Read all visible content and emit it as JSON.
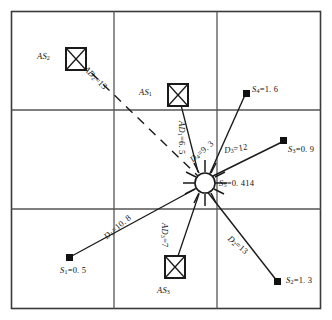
{
  "figure": {
    "type": "diagram",
    "grid": {
      "rows": 3,
      "cols": 3,
      "border_color": "#3a3a3a",
      "line_color": "#555555"
    },
    "center_node": {
      "name": "center-sun-node",
      "label_symbol": "S",
      "label_sub": "5",
      "label_value": "=0. 414",
      "label_full": "S5 =0. 414",
      "x": 205,
      "y": 182
    },
    "sensor_nodes": [
      {
        "id": "S1",
        "symbol": "S",
        "sub": "1",
        "value": "=0. 5",
        "label": "S1=0.5",
        "x": 68,
        "y": 258,
        "label_x": 64,
        "label_y": 266
      },
      {
        "id": "S2",
        "symbol": "S",
        "sub": "2",
        "value": "=1. 3",
        "label": "S2=1.3",
        "x": 278,
        "y": 282,
        "label_x": 286,
        "label_y": 276
      },
      {
        "id": "S3",
        "symbol": "S",
        "sub": "3",
        "value": "=0. 9",
        "label": "S3=0.9",
        "x": 284,
        "y": 140,
        "label_x": 288,
        "label_y": 148
      },
      {
        "id": "S4",
        "symbol": "S",
        "sub": "4",
        "value": "=1. 6",
        "label": "S4=1.6",
        "x": 247,
        "y": 93,
        "label_x": 252,
        "label_y": 87
      }
    ],
    "anchor_nodes": [
      {
        "id": "AS1",
        "symbol": "AS",
        "sub": "1",
        "label": "AS1",
        "box_x": 168,
        "box_y": 91,
        "label_x": 139,
        "label_y": 93
      },
      {
        "id": "AS2",
        "symbol": "AS",
        "sub": "2",
        "label": "AS2",
        "box_x": 66,
        "box_y": 49,
        "label_x": 38,
        "label_y": 55
      },
      {
        "id": "AS3",
        "symbol": "AS",
        "sub": "3",
        "label": "AS3",
        "box_x": 165,
        "box_y": 259,
        "label_x": 158,
        "label_y": 294
      }
    ],
    "distance_labels": [
      {
        "id": "D1",
        "symbol": "D",
        "sub": "1",
        "value": "=10. 8",
        "label": "D1=10.8",
        "x": 112,
        "y": 224,
        "rotation": -40
      },
      {
        "id": "D2",
        "symbol": "D",
        "sub": "2",
        "value": "=13",
        "label": "D2=13",
        "x": 229,
        "y": 230,
        "rotation": 40
      },
      {
        "id": "D3",
        "symbol": "D",
        "sub": "3",
        "value": "=12",
        "label": "D3=12",
        "x": 226,
        "y": 152,
        "rotation": 0
      },
      {
        "id": "D4",
        "symbol": "D",
        "sub": "4",
        "value": "=9. 3",
        "label": "D4=9.3",
        "x": 196,
        "y": 148,
        "rotation": -40
      },
      {
        "id": "AD1",
        "symbol": "AD",
        "sub": "1",
        "value": "=6. 5",
        "label": "AD1=6.5",
        "x": 176,
        "y": 112,
        "rotation": 90
      },
      {
        "id": "AD2",
        "symbol": "AD",
        "sub": "2",
        "value": "=13",
        "label": "AD2=13",
        "x": 84,
        "y": 56,
        "rotation": 45
      },
      {
        "id": "AD3",
        "symbol": "AD",
        "sub": "3",
        "value": "=7",
        "label": "AD3=7",
        "x": 159,
        "y": 212,
        "rotation": 90
      }
    ],
    "colors": {
      "stroke": "#1a1a1a",
      "grid": "#555555",
      "background": "#ffffff"
    }
  }
}
